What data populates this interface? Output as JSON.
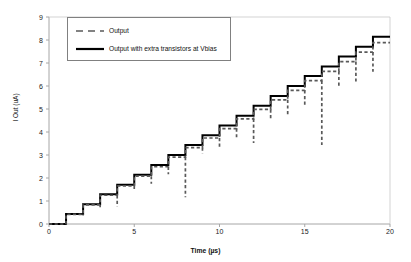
{
  "chart_data": {
    "type": "line",
    "title": "",
    "xlabel": "Time (µs)",
    "ylabel": "I Out (uA)",
    "xlim": [
      0,
      20
    ],
    "ylim": [
      0,
      9
    ],
    "xticks": [
      0,
      5,
      10,
      15,
      20
    ],
    "yticks": [
      0,
      1,
      2,
      3,
      4,
      5,
      6,
      7,
      8,
      9
    ],
    "grid": false,
    "legend_position": "top-left",
    "series": [
      {
        "name": "Output",
        "style": "dashed",
        "color": "#595959",
        "description": "Staircase DAC output with downward glitch spikes at each code transition",
        "x": [
          0,
          1,
          1,
          2,
          2,
          3,
          3,
          4,
          4,
          5,
          5,
          6,
          6,
          7,
          7,
          8,
          8,
          9,
          9,
          10,
          10,
          11,
          11,
          12,
          12,
          13,
          13,
          14,
          14,
          15,
          15,
          16,
          16,
          17,
          17,
          18,
          18,
          19,
          19,
          20
        ],
        "y": [
          0.0,
          0.0,
          0.42,
          0.42,
          0.83,
          0.83,
          1.25,
          1.25,
          1.66,
          1.66,
          2.08,
          2.08,
          2.49,
          2.49,
          2.91,
          2.91,
          3.32,
          3.32,
          3.74,
          3.74,
          4.15,
          4.15,
          4.57,
          4.57,
          4.98,
          4.98,
          5.4,
          5.4,
          5.81,
          5.81,
          6.23,
          6.23,
          6.64,
          6.64,
          7.06,
          7.06,
          7.47,
          7.47,
          7.89,
          7.89
        ],
        "glitches": [
          {
            "t": 1,
            "depth": 0.0
          },
          {
            "t": 2,
            "depth": 0.05
          },
          {
            "t": 3,
            "depth": 0.1
          },
          {
            "t": 4,
            "depth": 0.5
          },
          {
            "t": 5,
            "depth": 0.18
          },
          {
            "t": 6,
            "depth": 0.33
          },
          {
            "t": 7,
            "depth": 0.33
          },
          {
            "t": 8,
            "depth": 1.75
          },
          {
            "t": 9,
            "depth": 0.25
          },
          {
            "t": 10,
            "depth": 0.45
          },
          {
            "t": 11,
            "depth": 0.48
          },
          {
            "t": 12,
            "depth": 1.05
          },
          {
            "t": 13,
            "depth": 0.4
          },
          {
            "t": 14,
            "depth": 0.73
          },
          {
            "t": 15,
            "depth": 0.72
          },
          {
            "t": 16,
            "depth": 2.8
          },
          {
            "t": 17,
            "depth": 0.66
          },
          {
            "t": 18,
            "depth": 0.9
          },
          {
            "t": 19,
            "depth": 0.85
          }
        ]
      },
      {
        "name": "Output with extra transistors at Vbias",
        "style": "solid",
        "color": "#000000",
        "description": "Glitch-free staircase DAC output",
        "x": [
          0,
          1,
          1,
          2,
          2,
          3,
          3,
          4,
          4,
          5,
          5,
          6,
          6,
          7,
          7,
          8,
          8,
          9,
          9,
          10,
          10,
          11,
          11,
          12,
          12,
          13,
          13,
          14,
          14,
          15,
          15,
          16,
          16,
          17,
          17,
          18,
          18,
          19,
          19,
          20
        ],
        "y": [
          0.0,
          0.0,
          0.43,
          0.43,
          0.86,
          0.86,
          1.29,
          1.29,
          1.71,
          1.71,
          2.14,
          2.14,
          2.57,
          2.57,
          3.0,
          3.0,
          3.43,
          3.43,
          3.86,
          3.86,
          4.28,
          4.28,
          4.71,
          4.71,
          5.14,
          5.14,
          5.57,
          5.57,
          6.0,
          6.0,
          6.43,
          6.43,
          6.85,
          6.85,
          7.28,
          7.28,
          7.71,
          7.71,
          8.14,
          8.14
        ]
      }
    ]
  },
  "axes": {
    "y_tick_labels": [
      "9",
      "8",
      "7",
      "6",
      "5",
      "4",
      "3",
      "2",
      "1",
      "0"
    ],
    "x_tick_labels": [
      "0",
      "5",
      "10",
      "15",
      "20"
    ],
    "y_title": "I Out (uA)",
    "x_title": "Time (µs)"
  },
  "legend": {
    "items": [
      {
        "label": "Output",
        "style": "dashed",
        "color": "#595959"
      },
      {
        "label": "Output with extra transistors at Vbias",
        "style": "solid",
        "color": "#000000"
      }
    ]
  },
  "colors": {
    "axis": "#a6a6a6",
    "tick_text": "#1a1a1a",
    "series_dashed": "#595959",
    "series_solid": "#000000",
    "legend_border": "#808080",
    "background": "#ffffff"
  }
}
